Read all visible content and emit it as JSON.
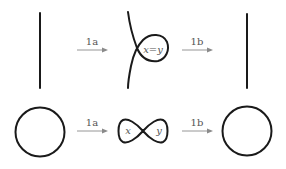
{
  "diagram": {
    "rows": [
      {
        "name": "strand-row",
        "arrows": [
          {
            "label": "1a"
          },
          {
            "label": "1b"
          }
        ],
        "middle_label": "x = y",
        "middle_label_parts": {
          "left": "x",
          "eq": "=",
          "right": "y"
        }
      },
      {
        "name": "circle-row",
        "arrows": [
          {
            "label": "1a"
          },
          {
            "label": "1b"
          }
        ],
        "middle_labels": {
          "left": "x",
          "right": "y"
        }
      }
    ],
    "colors": {
      "stroke": "#1a1a1a",
      "arrow": "#8a8a8a",
      "text": "#555555",
      "background": "#ffffff"
    }
  }
}
